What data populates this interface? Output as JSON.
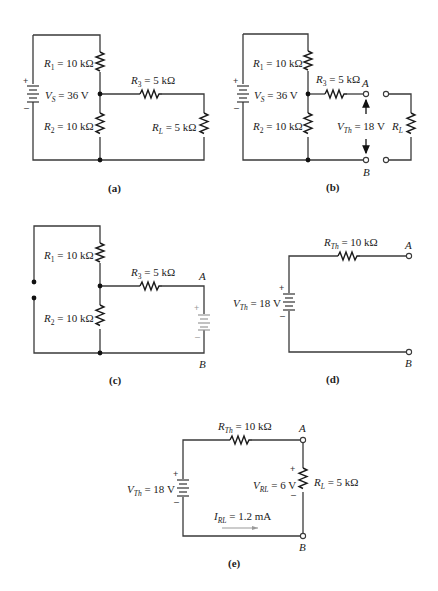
{
  "figure": {
    "panels": [
      {
        "id": "a",
        "caption": "(a)",
        "source": {
          "name": "V",
          "sub": "S",
          "value": " = 36 V",
          "plus": "+",
          "minus": "–"
        },
        "r1": {
          "name": "R",
          "sub": "1",
          "value": " = 10 kΩ"
        },
        "r2": {
          "name": "R",
          "sub": "2",
          "value": " = 10 kΩ"
        },
        "r3": {
          "name": "R",
          "sub": "3",
          "value": " = 5 kΩ"
        },
        "rl": {
          "name": "R",
          "sub": "L",
          "value": " = 5 kΩ"
        }
      },
      {
        "id": "b",
        "caption": "(b)",
        "source": {
          "name": "V",
          "sub": "S",
          "value": " = 36 V",
          "plus": "+",
          "minus": "–"
        },
        "r1": {
          "name": "R",
          "sub": "1",
          "value": " = 10 kΩ"
        },
        "r2": {
          "name": "R",
          "sub": "2",
          "value": " = 10 kΩ"
        },
        "r3": {
          "name": "R",
          "sub": "3",
          "value": " = 5 kΩ"
        },
        "vth": {
          "name": "V",
          "sub": "Th",
          "value": " = 18 V"
        },
        "rl": {
          "name": "R",
          "sub": "L"
        },
        "terminal_a": "A",
        "terminal_b": "B"
      },
      {
        "id": "c",
        "caption": "(c)",
        "r1": {
          "name": "R",
          "sub": "1",
          "value": " = 10 kΩ"
        },
        "r2": {
          "name": "R",
          "sub": "2",
          "value": " = 10 kΩ"
        },
        "r3": {
          "name": "R",
          "sub": "3",
          "value": " = 5 kΩ"
        },
        "ghost_source": {
          "plus": "+",
          "minus": "–"
        },
        "terminal_a": "A",
        "terminal_b": "B"
      },
      {
        "id": "d",
        "caption": "(d)",
        "source": {
          "name": "V",
          "sub": "Th",
          "value": " = 18 V",
          "plus": "+",
          "minus": "–"
        },
        "rth": {
          "name": "R",
          "sub": "Th",
          "value": " = 10 kΩ"
        },
        "terminal_a": "A",
        "terminal_b": "B"
      },
      {
        "id": "e",
        "caption": "(e)",
        "source": {
          "name": "V",
          "sub": "Th",
          "value": " = 18 V",
          "plus": "+",
          "minus": "–"
        },
        "rth": {
          "name": "R",
          "sub": "Th",
          "value": " = 10 kΩ"
        },
        "vrl": {
          "name": "V",
          "sub": "RL",
          "value": " = 6 V",
          "plus": "+",
          "minus": "–"
        },
        "rl": {
          "name": "R",
          "sub": "L",
          "value": " = 5 kΩ"
        },
        "irl": {
          "name": "I",
          "sub": "RL",
          "value": " = 1.2 mA"
        },
        "terminal_a": "A",
        "terminal_b": "B"
      }
    ]
  }
}
